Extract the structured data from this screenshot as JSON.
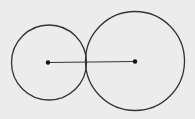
{
  "diagram": {
    "type": "tangent-circles",
    "background": "#ececec",
    "stroke_color": "#333333",
    "circles": [
      {
        "id": "left-circle",
        "cx": 49,
        "cy": 62.5,
        "r": 37.5
      },
      {
        "id": "right-circle",
        "cx": 135,
        "cy": 61,
        "r": 49.5
      }
    ],
    "center_points": [
      {
        "id": "left-center",
        "x": 48,
        "y": 62.5
      },
      {
        "id": "right-center",
        "x": 135,
        "y": 61.5
      }
    ],
    "segment": {
      "x1": 48,
      "y1": 62.5,
      "x2": 135,
      "y2": 61.5
    }
  }
}
